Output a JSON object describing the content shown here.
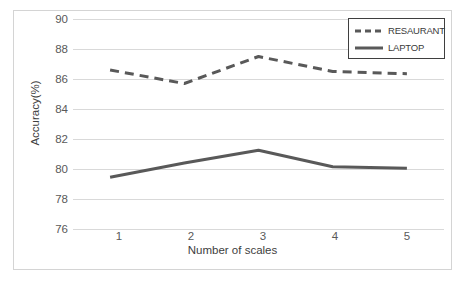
{
  "chart_data": {
    "type": "line",
    "title": "",
    "xlabel": "Number of scales",
    "ylabel": "Accuracy(%)",
    "x": [
      1,
      2,
      3,
      4,
      5
    ],
    "categories": [
      "1",
      "2",
      "3",
      "4",
      "5"
    ],
    "xticklabels": [
      "1",
      "2",
      "3",
      "4",
      "5"
    ],
    "yticklabels": [
      "76",
      "78",
      "80",
      "82",
      "84",
      "86",
      "88",
      "90"
    ],
    "yticks": [
      76,
      78,
      80,
      82,
      84,
      86,
      88,
      90
    ],
    "ylim": [
      76,
      90
    ],
    "xlim": [
      0.5,
      5.5
    ],
    "grid": "horizontal",
    "legend_position": "top-right",
    "series": [
      {
        "name": "RESAURANT",
        "style": "dashed",
        "color": "#595959",
        "values": [
          86.6,
          85.7,
          87.5,
          86.5,
          86.35
        ]
      },
      {
        "name": "LAPTOP",
        "style": "solid",
        "color": "#595959",
        "values": [
          79.45,
          80.4,
          81.25,
          80.15,
          80.05
        ]
      }
    ]
  },
  "legend": {
    "items": [
      {
        "label": "RESAURANT",
        "style": "dashed"
      },
      {
        "label": "LAPTOP",
        "style": "solid"
      }
    ]
  },
  "caption": {
    "text": ""
  },
  "colors": {
    "line": "#595959",
    "gridline": "#d9d9d9",
    "frame": "#d4d4d4",
    "legend_border": "#3f3f3f",
    "tick_text": "#595959",
    "axis_title": "#404040"
  }
}
